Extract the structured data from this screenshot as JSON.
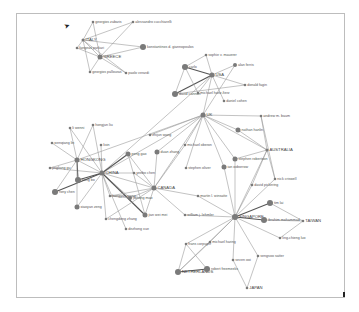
{
  "diagram": {
    "type": "network-graph",
    "nodes": [
      {
        "id": "greece",
        "label": "GREECE",
        "x": 100,
        "y": 57,
        "r": 2.5,
        "country": true
      },
      {
        "id": "italy",
        "label": "ITALY",
        "x": 83,
        "y": 40,
        "r": 1.5,
        "country": true
      },
      {
        "id": "georgios_zabaris",
        "label": "georgios zabaris",
        "x": 93,
        "y": 22,
        "r": 1.3
      },
      {
        "id": "alessandro",
        "label": "alessandro cucchiarelli",
        "x": 133,
        "y": 22,
        "r": 1.3
      },
      {
        "id": "fangeas",
        "label": "fangeas parkari",
        "x": 77,
        "y": 48,
        "r": 1.3
      },
      {
        "id": "konstantinos",
        "label": "konstantinos d. giannopoulos",
        "x": 143,
        "y": 47,
        "r": 3
      },
      {
        "id": "georgios_pallouras",
        "label": "georgios pallouras",
        "x": 90,
        "y": 72,
        "r": 1.3
      },
      {
        "id": "paolo",
        "label": "paolo verardi",
        "x": 126,
        "y": 73,
        "r": 1.3
      },
      {
        "id": "usa",
        "label": "USA",
        "x": 212,
        "y": 75,
        "r": 2.5,
        "country": true
      },
      {
        "id": "sophie",
        "label": "sophie v. mauerer",
        "x": 206,
        "y": 55,
        "r": 1.3
      },
      {
        "id": "alan",
        "label": "alan ferris",
        "x": 235,
        "y": 65,
        "r": 2
      },
      {
        "id": "carlo",
        "label": "carlo",
        "x": 185,
        "y": 67,
        "r": 3
      },
      {
        "id": "donald",
        "label": "donald fagin",
        "x": 245,
        "y": 85,
        "r": 1.3
      },
      {
        "id": "david_cannon",
        "label": "david cannon",
        "x": 175,
        "y": 94,
        "r": 3
      },
      {
        "id": "michael_hartz",
        "label": "michael hartz-fierz",
        "x": 198,
        "y": 93,
        "r": 1.3
      },
      {
        "id": "daniel",
        "label": "daniel cohen",
        "x": 224,
        "y": 101,
        "r": 1.3
      },
      {
        "id": "uk",
        "label": "UK",
        "x": 203,
        "y": 115,
        "r": 2.5,
        "country": true
      },
      {
        "id": "andrew",
        "label": "andrew m. baum",
        "x": 261,
        "y": 116,
        "r": 1.3
      },
      {
        "id": "nathan",
        "label": "nathan hanlin",
        "x": 238,
        "y": 130,
        "r": 2.5
      },
      {
        "id": "australia",
        "label": "AUSTRALIA",
        "x": 267,
        "y": 150,
        "r": 1.5,
        "country": true
      },
      {
        "id": "stephen_robertson",
        "label": "stephen robertson",
        "x": 235,
        "y": 159,
        "r": 2.5
      },
      {
        "id": "ian_oxborrow",
        "label": "ian oxborrow",
        "x": 224,
        "y": 167,
        "r": 2.5
      },
      {
        "id": "nick",
        "label": "nick criswell",
        "x": 275,
        "y": 179,
        "r": 1.3
      },
      {
        "id": "david_pickering",
        "label": "david pickering",
        "x": 252,
        "y": 185,
        "r": 1.3
      },
      {
        "id": "michael_oberon",
        "label": "michael oberon",
        "x": 185,
        "y": 145,
        "r": 1.3
      },
      {
        "id": "stephen_oliver",
        "label": "stephen oliver",
        "x": 186,
        "y": 168,
        "r": 1.3
      },
      {
        "id": "duan_zhang",
        "label": "duan zhang",
        "x": 157,
        "y": 152,
        "r": 2.5
      },
      {
        "id": "zhijun_wang",
        "label": "zhijun wang",
        "x": 150,
        "y": 135,
        "r": 1.3
      },
      {
        "id": "china",
        "label": "CHINA",
        "x": 102,
        "y": 173,
        "r": 2.5,
        "country": true
      },
      {
        "id": "hongkong",
        "label": "HONGKONG",
        "x": 77,
        "y": 160,
        "r": 2.5,
        "country": true
      },
      {
        "id": "li_wenni",
        "label": "li wenni",
        "x": 70,
        "y": 128,
        "r": 1.3
      },
      {
        "id": "hongjun",
        "label": "hongjun liu",
        "x": 93,
        "y": 125,
        "r": 1.3
      },
      {
        "id": "wenqiang",
        "label": "wenqiang lin",
        "x": 52,
        "y": 143,
        "r": 1.3
      },
      {
        "id": "lixin",
        "label": "lixin",
        "x": 101,
        "y": 145,
        "r": 1.3
      },
      {
        "id": "jingliang",
        "label": "jingliang gu",
        "x": 50,
        "y": 168,
        "r": 1.3
      },
      {
        "id": "kong_bo",
        "label": "kong bo",
        "x": 78,
        "y": 180,
        "r": 3
      },
      {
        "id": "rony_chen",
        "label": "rony chen",
        "x": 55,
        "y": 192,
        "r": 3
      },
      {
        "id": "xiaoyan",
        "label": "xiaoyan zeng",
        "x": 77,
        "y": 207,
        "r": 2.5
      },
      {
        "id": "peng",
        "label": "peng gao",
        "x": 128,
        "y": 154,
        "r": 2.5
      },
      {
        "id": "yeebo",
        "label": "yeebo chen",
        "x": 134,
        "y": 173,
        "r": 1.3
      },
      {
        "id": "hongyan",
        "label": "hongyan wang",
        "x": 110,
        "y": 196,
        "r": 1.3
      },
      {
        "id": "jiahong",
        "label": "jiahong mao",
        "x": 130,
        "y": 198,
        "r": 2
      },
      {
        "id": "canada",
        "label": "CANADA",
        "x": 154,
        "y": 188,
        "r": 2.5,
        "country": true
      },
      {
        "id": "chengdong",
        "label": "chengdong zhang",
        "x": 106,
        "y": 219,
        "r": 1.3
      },
      {
        "id": "dezhong",
        "label": "dezhong xue",
        "x": 126,
        "y": 229,
        "r": 1.3
      },
      {
        "id": "jian_wei",
        "label": "jian wei mei",
        "x": 145,
        "y": 215,
        "r": 2.5
      },
      {
        "id": "martin",
        "label": "martin l. winsatte",
        "x": 198,
        "y": 196,
        "r": 1.3
      },
      {
        "id": "william",
        "label": "william j. lehmler",
        "x": 185,
        "y": 215,
        "r": 1.3
      },
      {
        "id": "singapore",
        "label": "SINGAPORE",
        "x": 235,
        "y": 217,
        "r": 3,
        "country": true
      },
      {
        "id": "tim",
        "label": "tim lai",
        "x": 270,
        "y": 203,
        "r": 3
      },
      {
        "id": "ibrahim",
        "label": "ibrahim mohammad",
        "x": 264,
        "y": 220,
        "r": 3
      },
      {
        "id": "taiwan",
        "label": "TAIWAN",
        "x": 303,
        "y": 221,
        "r": 1.3,
        "country": true
      },
      {
        "id": "ling",
        "label": "ling-chieng luo",
        "x": 280,
        "y": 238,
        "r": 1.3
      },
      {
        "id": "sengsoo",
        "label": "sengsoo satter",
        "x": 258,
        "y": 256,
        "r": 1.3
      },
      {
        "id": "seven_ooi",
        "label": "seven ooi",
        "x": 233,
        "y": 260,
        "r": 1.3
      },
      {
        "id": "japan",
        "label": "JAPAN",
        "x": 247,
        "y": 288,
        "r": 1.3,
        "country": true
      },
      {
        "id": "frans",
        "label": "frans corpuyer",
        "x": 186,
        "y": 244,
        "r": 1.3
      },
      {
        "id": "michael_haring",
        "label": "michael haring",
        "x": 210,
        "y": 242,
        "r": 1.3
      },
      {
        "id": "netherlands",
        "label": "NETHERLANDS",
        "x": 178,
        "y": 272,
        "r": 3,
        "country": true
      },
      {
        "id": "robert",
        "label": "robert freemeeks",
        "x": 207,
        "y": 269,
        "r": 3
      }
    ],
    "edges": [
      [
        "greece",
        "italy"
      ],
      [
        "greece",
        "georgios_zabaris"
      ],
      [
        "greece",
        "alessandro"
      ],
      [
        "greece",
        "fangeas"
      ],
      [
        "greece",
        "konstantinos"
      ],
      [
        "greece",
        "georgios_pallouras"
      ],
      [
        "greece",
        "paolo"
      ],
      [
        "italy",
        "georgios_zabaris"
      ],
      [
        "italy",
        "alessandro"
      ],
      [
        "italy",
        "fangeas"
      ],
      [
        "italy",
        "konstantinos"
      ],
      [
        "italy",
        "georgios_pallouras"
      ],
      [
        "italy",
        "paolo"
      ],
      [
        "usa",
        "sophie"
      ],
      [
        "usa",
        "alan"
      ],
      [
        "usa",
        "carlo"
      ],
      [
        "usa",
        "donald"
      ],
      [
        "usa",
        "david_cannon"
      ],
      [
        "usa",
        "michael_hartz"
      ],
      [
        "usa",
        "daniel"
      ],
      [
        "usa",
        "uk"
      ],
      [
        "carlo",
        "david_cannon"
      ],
      [
        "carlo",
        "sophie"
      ],
      [
        "carlo",
        "michael_hartz"
      ],
      [
        "david_cannon",
        "donald"
      ],
      [
        "alan",
        "uk"
      ],
      [
        "usa",
        "china"
      ],
      [
        "uk",
        "andrew"
      ],
      [
        "uk",
        "nathan"
      ],
      [
        "uk",
        "australia"
      ],
      [
        "uk",
        "stephen_robertson"
      ],
      [
        "uk",
        "ian_oxborrow"
      ],
      [
        "uk",
        "michael_oberon"
      ],
      [
        "uk",
        "stephen_oliver"
      ],
      [
        "uk",
        "duan_zhang"
      ],
      [
        "uk",
        "zhijun_wang"
      ],
      [
        "uk",
        "canada"
      ],
      [
        "uk",
        "china"
      ],
      [
        "uk",
        "hongkong"
      ],
      [
        "andrew",
        "australia"
      ],
      [
        "nathan",
        "australia"
      ],
      [
        "australia",
        "stephen_robertson"
      ],
      [
        "australia",
        "nick"
      ],
      [
        "australia",
        "david_pickering"
      ],
      [
        "andrew",
        "nick"
      ],
      [
        "australia",
        "singapore"
      ],
      [
        "china",
        "hongkong"
      ],
      [
        "china",
        "li_wenni"
      ],
      [
        "china",
        "hongjun"
      ],
      [
        "china",
        "lixin"
      ],
      [
        "china",
        "kong_bo"
      ],
      [
        "china",
        "rony_chen"
      ],
      [
        "china",
        "xiaoyan"
      ],
      [
        "china",
        "peng"
      ],
      [
        "china",
        "yeebo"
      ],
      [
        "china",
        "hongyan"
      ],
      [
        "china",
        "jiahong"
      ],
      [
        "china",
        "canada"
      ],
      [
        "china",
        "chengdong"
      ],
      [
        "china",
        "dezhong"
      ],
      [
        "china",
        "jian_wei"
      ],
      [
        "china",
        "jingliang"
      ],
      [
        "hongkong",
        "li_wenni"
      ],
      [
        "hongkong",
        "hongjun"
      ],
      [
        "hongkong",
        "wenqiang"
      ],
      [
        "hongkong",
        "jingliang"
      ],
      [
        "hongkong",
        "kong_bo"
      ],
      [
        "hongkong",
        "rony_chen"
      ],
      [
        "hongkong",
        "xiaoyan"
      ],
      [
        "canada",
        "peng"
      ],
      [
        "canada",
        "yeebo"
      ],
      [
        "canada",
        "hongyan"
      ],
      [
        "canada",
        "jiahong"
      ],
      [
        "canada",
        "jian_wei"
      ],
      [
        "canada",
        "martin"
      ],
      [
        "canada",
        "william"
      ],
      [
        "canada",
        "duan_zhang"
      ],
      [
        "canada",
        "michael_oberon"
      ],
      [
        "canada",
        "chengdong"
      ],
      [
        "peng",
        "jian_wei"
      ],
      [
        "hongyan",
        "jiahong"
      ],
      [
        "singapore",
        "martin"
      ],
      [
        "singapore",
        "william"
      ],
      [
        "singapore",
        "tim"
      ],
      [
        "singapore",
        "ibrahim"
      ],
      [
        "singapore",
        "ling"
      ],
      [
        "singapore",
        "sengsoo"
      ],
      [
        "singapore",
        "seven_ooi"
      ],
      [
        "singapore",
        "frans"
      ],
      [
        "singapore",
        "michael_haring"
      ],
      [
        "singapore",
        "netherlands"
      ],
      [
        "singapore",
        "stephen_robertson"
      ],
      [
        "singapore",
        "ian_oxborrow"
      ],
      [
        "singapore",
        "david_pickering"
      ],
      [
        "singapore",
        "nick"
      ],
      [
        "tim",
        "taiwan"
      ],
      [
        "ibrahim",
        "taiwan"
      ],
      [
        "ling",
        "taiwan"
      ],
      [
        "seven_ooi",
        "japan"
      ],
      [
        "sengsoo",
        "japan"
      ],
      [
        "netherlands",
        "robert"
      ],
      [
        "netherlands",
        "frans"
      ],
      [
        "netherlands",
        "michael_haring"
      ],
      [
        "robert",
        "frans"
      ]
    ],
    "heavy_edges": [
      [
        "china",
        "kong_bo"
      ],
      [
        "china",
        "rony_chen"
      ],
      [
        "hongkong",
        "kong_bo"
      ],
      [
        "usa",
        "carlo"
      ],
      [
        "usa",
        "david_cannon"
      ],
      [
        "singapore",
        "tim"
      ],
      [
        "singapore",
        "ibrahim"
      ],
      [
        "china",
        "jian_wei"
      ],
      [
        "china",
        "peng"
      ],
      [
        "netherlands",
        "robert"
      ]
    ]
  }
}
